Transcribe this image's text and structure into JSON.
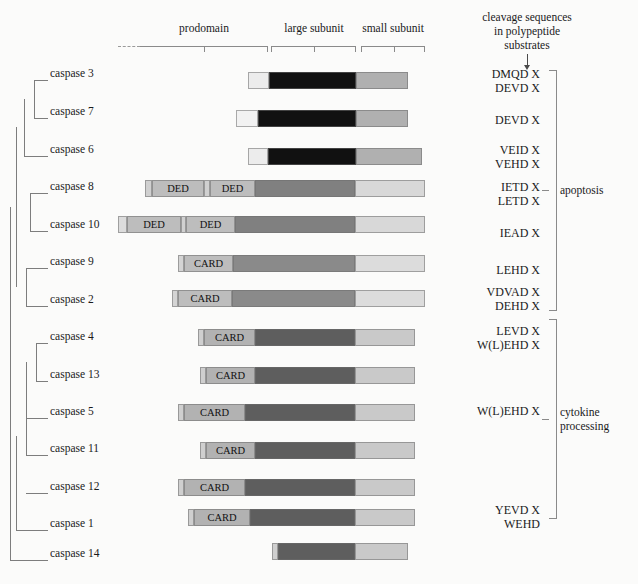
{
  "figure": {
    "background_color": "#fbfbfa"
  },
  "ruler": {
    "labels": [
      {
        "text": "prodomain",
        "x": 140,
        "w": 128,
        "y": 22
      },
      {
        "text": "large subunit",
        "x": 270,
        "w": 88,
        "y": 22
      },
      {
        "text": "small subunit",
        "x": 360,
        "w": 66,
        "y": 22
      }
    ],
    "dashed_prefix": true
  },
  "header": {
    "line1": "cleavage sequences",
    "line2": "in polypeptide",
    "line3": "substrates"
  },
  "colors": {
    "prodomain_light": "#d9d9d9",
    "prodomain_mid": "#b9b9b9",
    "large_black": "#111111",
    "large_dark": "#5e5e5e",
    "large_darker": "#4a4a4a",
    "small_gray": "#b0b0b0",
    "small_light": "#d8d8d8",
    "small_lighter": "#c9c9c9",
    "white_cap": "#f2f2f2",
    "line": "#7d7d7d"
  },
  "domain_labels": {
    "ded": "DED",
    "card": "CARD"
  },
  "groups": [
    {
      "name": "apoptosis",
      "label": "apoptosis",
      "top": 70,
      "bottom": 311,
      "tick_y": 190
    },
    {
      "name": "cytokine-processing",
      "label_line1": "cytokine",
      "label_line2": "processing",
      "top": 319,
      "bottom": 519,
      "tick_y": 419
    }
  ],
  "rows": [
    {
      "id": "caspase-3",
      "label": "caspase 3",
      "label_x": 50,
      "label_y": 75,
      "bar_y": 72,
      "segments": [
        {
          "name": "prodomain",
          "x": 248,
          "w": 21,
          "color": "#ececec",
          "text": ""
        },
        {
          "name": "large-subunit",
          "x": 269,
          "w": 87,
          "color": "#111111",
          "text": ""
        },
        {
          "name": "small-subunit",
          "x": 356,
          "w": 52,
          "color": "#b0b0b0",
          "text": ""
        }
      ],
      "sequences": [
        "DMQD  X",
        "DEVD  X"
      ],
      "seq_y": 67
    },
    {
      "id": "caspase-7",
      "label": "caspase 7",
      "label_x": 50,
      "label_y": 113,
      "bar_y": 110,
      "segments": [
        {
          "name": "prodomain",
          "x": 236,
          "w": 22,
          "color": "#f2f2f2",
          "text": ""
        },
        {
          "name": "large-subunit",
          "x": 258,
          "w": 98,
          "color": "#111111",
          "text": ""
        },
        {
          "name": "small-subunit",
          "x": 356,
          "w": 52,
          "color": "#b0b0b0",
          "text": ""
        }
      ],
      "sequences": [
        "DEVD  X"
      ],
      "seq_y": 113
    },
    {
      "id": "caspase-6",
      "label": "caspase 6",
      "label_x": 50,
      "label_y": 151,
      "bar_y": 148,
      "segments": [
        {
          "name": "prodomain",
          "x": 248,
          "w": 20,
          "color": "#ececec",
          "text": ""
        },
        {
          "name": "large-subunit",
          "x": 268,
          "w": 88,
          "color": "#111111",
          "text": ""
        },
        {
          "name": "small-subunit",
          "x": 356,
          "w": 66,
          "color": "#b0b0b0",
          "text": ""
        }
      ],
      "sequences": [
        "VEID  X",
        "VEHD  X"
      ],
      "seq_y": 143
    },
    {
      "id": "caspase-8",
      "label": "caspase 8",
      "label_x": 50,
      "label_y": 188,
      "bar_y": 180,
      "segments": [
        {
          "name": "prodomain-cap",
          "x": 145,
          "w": 7,
          "color": "#d0d0d0",
          "text": ""
        },
        {
          "name": "ded-1",
          "x": 152,
          "w": 52,
          "color": "#bdbdbd",
          "text": "DED"
        },
        {
          "name": "ded-gap",
          "x": 204,
          "w": 6,
          "color": "#d0d0d0",
          "text": ""
        },
        {
          "name": "ded-2",
          "x": 210,
          "w": 45,
          "color": "#bdbdbd",
          "text": "DED"
        },
        {
          "name": "large-subunit",
          "x": 255,
          "w": 100,
          "color": "#808080",
          "text": ""
        },
        {
          "name": "small-subunit",
          "x": 355,
          "w": 70,
          "color": "#d8d8d8",
          "text": ""
        }
      ],
      "sequences": [
        "IETD  X",
        "LETD  X"
      ],
      "seq_y": 180
    },
    {
      "id": "caspase-10",
      "label": "caspase 10",
      "label_x": 50,
      "label_y": 226,
      "bar_y": 216,
      "segments": [
        {
          "name": "prodomain-cap",
          "x": 118,
          "w": 9,
          "color": "#dcdcdc",
          "text": ""
        },
        {
          "name": "ded-1",
          "x": 127,
          "w": 54,
          "color": "#bdbdbd",
          "text": "DED"
        },
        {
          "name": "ded-gap",
          "x": 181,
          "w": 5,
          "color": "#d0d0d0",
          "text": ""
        },
        {
          "name": "ded-2",
          "x": 186,
          "w": 49,
          "color": "#bdbdbd",
          "text": "DED"
        },
        {
          "name": "large-subunit",
          "x": 235,
          "w": 120,
          "color": "#808080",
          "text": ""
        },
        {
          "name": "small-subunit",
          "x": 355,
          "w": 70,
          "color": "#d8d8d8",
          "text": ""
        }
      ],
      "sequences": [
        "IEAD  X"
      ],
      "seq_y": 226
    },
    {
      "id": "caspase-9",
      "label": "caspase 9",
      "label_x": 50,
      "label_y": 263,
      "bar_y": 255,
      "segments": [
        {
          "name": "prodomain-cap",
          "x": 178,
          "w": 6,
          "color": "#d4d4d4",
          "text": ""
        },
        {
          "name": "card",
          "x": 184,
          "w": 49,
          "color": "#bdbdbd",
          "text": "CARD"
        },
        {
          "name": "large-subunit",
          "x": 233,
          "w": 122,
          "color": "#8a8a8a",
          "text": ""
        },
        {
          "name": "small-subunit",
          "x": 355,
          "w": 70,
          "color": "#dcdcdc",
          "text": ""
        }
      ],
      "sequences": [
        "LEHD  X"
      ],
      "seq_y": 263
    },
    {
      "id": "caspase-2",
      "label": "caspase 2",
      "label_x": 50,
      "label_y": 301,
      "bar_y": 290,
      "segments": [
        {
          "name": "prodomain-cap",
          "x": 172,
          "w": 6,
          "color": "#d4d4d4",
          "text": ""
        },
        {
          "name": "card",
          "x": 178,
          "w": 54,
          "color": "#bdbdbd",
          "text": "CARD"
        },
        {
          "name": "large-subunit",
          "x": 232,
          "w": 123,
          "color": "#8a8a8a",
          "text": ""
        },
        {
          "name": "small-subunit",
          "x": 355,
          "w": 70,
          "color": "#dcdcdc",
          "text": ""
        }
      ],
      "sequences": [
        "VDVAD  X",
        "DEHD  X"
      ],
      "seq_y": 285
    },
    {
      "id": "caspase-4",
      "label": "caspase 4",
      "label_x": 50,
      "label_y": 338,
      "bar_y": 329,
      "segments": [
        {
          "name": "prodomain-cap",
          "x": 198,
          "w": 6,
          "color": "#cfcfcf",
          "text": ""
        },
        {
          "name": "card",
          "x": 204,
          "w": 51,
          "color": "#b2b2b2",
          "text": "CARD"
        },
        {
          "name": "large-subunit",
          "x": 255,
          "w": 100,
          "color": "#5e5e5e",
          "text": ""
        },
        {
          "name": "small-subunit",
          "x": 355,
          "w": 60,
          "color": "#c9c9c9",
          "text": ""
        }
      ],
      "sequences": [
        "LEVD  X",
        "W(L)EHD  X"
      ],
      "seq_y": 324
    },
    {
      "id": "caspase-13",
      "label": "caspase 13",
      "label_x": 50,
      "label_y": 376,
      "bar_y": 367,
      "segments": [
        {
          "name": "prodomain-cap",
          "x": 200,
          "w": 6,
          "color": "#cfcfcf",
          "text": ""
        },
        {
          "name": "card",
          "x": 206,
          "w": 49,
          "color": "#b2b2b2",
          "text": "CARD"
        },
        {
          "name": "large-subunit",
          "x": 255,
          "w": 100,
          "color": "#5e5e5e",
          "text": ""
        },
        {
          "name": "small-subunit",
          "x": 355,
          "w": 60,
          "color": "#c9c9c9",
          "text": ""
        }
      ],
      "sequences": [],
      "seq_y": 376
    },
    {
      "id": "caspase-5",
      "label": "caspase 5",
      "label_x": 50,
      "label_y": 413,
      "bar_y": 404,
      "segments": [
        {
          "name": "prodomain-cap",
          "x": 178,
          "w": 6,
          "color": "#cfcfcf",
          "text": ""
        },
        {
          "name": "card",
          "x": 184,
          "w": 61,
          "color": "#b2b2b2",
          "text": "CARD"
        },
        {
          "name": "large-subunit",
          "x": 245,
          "w": 110,
          "color": "#5e5e5e",
          "text": ""
        },
        {
          "name": "small-subunit",
          "x": 355,
          "w": 60,
          "color": "#c9c9c9",
          "text": ""
        }
      ],
      "sequences": [
        "W(L)EHD  X"
      ],
      "seq_y": 404
    },
    {
      "id": "caspase-11",
      "label": "caspase 11",
      "label_x": 50,
      "label_y": 450,
      "bar_y": 442,
      "segments": [
        {
          "name": "prodomain-cap",
          "x": 200,
          "w": 6,
          "color": "#cfcfcf",
          "text": ""
        },
        {
          "name": "card",
          "x": 206,
          "w": 49,
          "color": "#b2b2b2",
          "text": "CARD"
        },
        {
          "name": "large-subunit",
          "x": 255,
          "w": 100,
          "color": "#5e5e5e",
          "text": ""
        },
        {
          "name": "small-subunit",
          "x": 355,
          "w": 60,
          "color": "#c9c9c9",
          "text": ""
        }
      ],
      "sequences": [],
      "seq_y": 442
    },
    {
      "id": "caspase-12",
      "label": "caspase 12",
      "label_x": 50,
      "label_y": 488,
      "bar_y": 479,
      "segments": [
        {
          "name": "prodomain-cap",
          "x": 178,
          "w": 6,
          "color": "#cfcfcf",
          "text": ""
        },
        {
          "name": "card",
          "x": 184,
          "w": 61,
          "color": "#b2b2b2",
          "text": "CARD"
        },
        {
          "name": "large-subunit",
          "x": 245,
          "w": 110,
          "color": "#5e5e5e",
          "text": ""
        },
        {
          "name": "small-subunit",
          "x": 355,
          "w": 60,
          "color": "#c9c9c9",
          "text": ""
        }
      ],
      "sequences": [],
      "seq_y": 479
    },
    {
      "id": "caspase-1",
      "label": "caspase 1",
      "label_x": 50,
      "label_y": 525,
      "bar_y": 509,
      "segments": [
        {
          "name": "prodomain-cap",
          "x": 188,
          "w": 6,
          "color": "#cfcfcf",
          "text": ""
        },
        {
          "name": "card",
          "x": 194,
          "w": 56,
          "color": "#b2b2b2",
          "text": "CARD"
        },
        {
          "name": "large-subunit",
          "x": 250,
          "w": 105,
          "color": "#5e5e5e",
          "text": ""
        },
        {
          "name": "small-subunit",
          "x": 355,
          "w": 60,
          "color": "#c9c9c9",
          "text": ""
        }
      ],
      "sequences": [
        "YEVD  X",
        "WEHD"
      ],
      "seq_y": 503
    },
    {
      "id": "caspase-14",
      "label": "caspase 14",
      "label_x": 50,
      "label_y": 555,
      "bar_y": 543,
      "segments": [
        {
          "name": "prodomain-cap",
          "x": 272,
          "w": 6,
          "color": "#cfcfcf",
          "text": ""
        },
        {
          "name": "large-subunit",
          "x": 278,
          "w": 77,
          "color": "#5e5e5e",
          "text": ""
        },
        {
          "name": "small-subunit",
          "x": 355,
          "w": 53,
          "color": "#c9c9c9",
          "text": ""
        }
      ],
      "sequences": [],
      "seq_y": 543
    }
  ],
  "tree": {
    "h_lines": [
      {
        "x": 34,
        "y": 80,
        "w": 14
      },
      {
        "x": 34,
        "y": 118,
        "w": 14
      },
      {
        "x": 24,
        "y": 156,
        "w": 24
      },
      {
        "x": 30,
        "y": 193,
        "w": 18
      },
      {
        "x": 30,
        "y": 231,
        "w": 18
      },
      {
        "x": 26,
        "y": 268,
        "w": 22
      },
      {
        "x": 26,
        "y": 306,
        "w": 22
      },
      {
        "x": 36,
        "y": 343,
        "w": 12
      },
      {
        "x": 36,
        "y": 381,
        "w": 12
      },
      {
        "x": 26,
        "y": 418,
        "w": 22
      },
      {
        "x": 26,
        "y": 455,
        "w": 22
      },
      {
        "x": 26,
        "y": 493,
        "w": 22
      },
      {
        "x": 16,
        "y": 530,
        "w": 32
      },
      {
        "x": 10,
        "y": 560,
        "w": 38
      }
    ],
    "v_lines": [
      {
        "x": 34,
        "y": 80,
        "h": 38
      },
      {
        "x": 24,
        "y": 99,
        "h": 57
      },
      {
        "x": 30,
        "y": 193,
        "h": 38
      },
      {
        "x": 26,
        "y": 268,
        "h": 38
      },
      {
        "x": 16,
        "y": 127,
        "h": 160
      },
      {
        "x": 36,
        "y": 343,
        "h": 38
      },
      {
        "x": 26,
        "y": 362,
        "h": 56
      },
      {
        "x": 26,
        "y": 418,
        "h": 37
      },
      {
        "x": 16,
        "y": 436,
        "h": 94
      },
      {
        "x": 10,
        "y": 207,
        "h": 353
      }
    ]
  }
}
